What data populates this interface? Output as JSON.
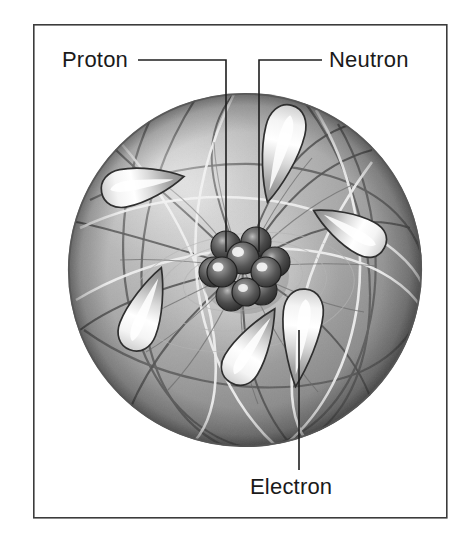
{
  "figure": {
    "kind": "atom-structure-diagram",
    "title_visible": false,
    "background_color": "#ffffff",
    "frame": {
      "visible": true,
      "color": "#3c3c3c",
      "x": 33,
      "y": 24,
      "width": 414,
      "height": 494
    },
    "palette": {
      "sphere_light": "#d2d2d2",
      "sphere_mid": "#9a9a9a",
      "sphere_dark": "#6f6f6f",
      "sphere_edge": "#5c5c5c",
      "orbit_light": "#ececec",
      "orbit_dark": "#4a4a4a",
      "electron_highlight": "#f6f6f6",
      "electron_body": "#a8a8a8",
      "electron_outline": "#2e2e2e",
      "nucleus_dark": "#3a3a3a",
      "nucleus_mid": "#6a6a6a",
      "nucleus_highlight": "#e8e8e8",
      "leader_line": "#1f1f1f",
      "label_text": "#1a1a1a"
    },
    "atom": {
      "sphere": {
        "center_x": 245,
        "center_y": 270,
        "radius": 177
      },
      "nucleus": {
        "center_x": 245,
        "center_y": 268,
        "radius": 38,
        "nucleon_count": 9
      },
      "electron_count": 6
    }
  },
  "labels": [
    {
      "id": "proton",
      "text": "Proton",
      "text_x": 62,
      "text_y": 67,
      "anchor": "start",
      "leader": "M 138 60 L 226 60 L 226 252"
    },
    {
      "id": "neutron",
      "text": "Neutron",
      "text_x": 329,
      "text_y": 67,
      "anchor": "start",
      "leader": "M 322 60 L 259 60 L 259 252"
    },
    {
      "id": "electron",
      "text": "Electron",
      "text_x": 250,
      "text_y": 494,
      "anchor": "start",
      "leader": "M 299 470 L 299 330"
    }
  ]
}
